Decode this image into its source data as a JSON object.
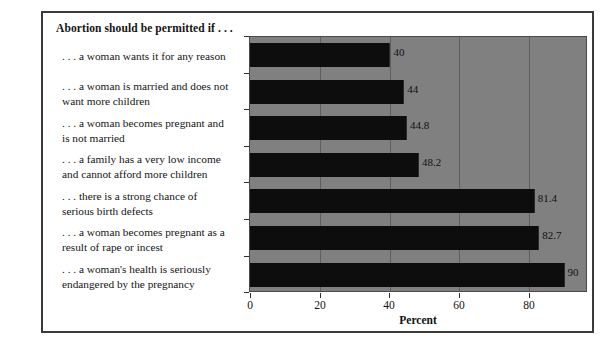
{
  "chart_data": {
    "type": "bar",
    "orientation": "horizontal",
    "title": "Abortion should be permitted if . . .",
    "xlabel": "Percent",
    "ylabel": "",
    "xlim": [
      0,
      97
    ],
    "xticks": [
      0,
      20,
      40,
      60,
      80
    ],
    "xticklabels": [
      "0",
      "20",
      "40",
      "60",
      "80"
    ],
    "grid": true,
    "grid_axis": "x",
    "legend": null,
    "bar_color": "#0d0d0d",
    "plot_background": "#808080",
    "categories": [
      ". . . a woman wants it for any reason",
      ". . . a woman is married and does not want more children",
      ". . . a woman becomes pregnant and is not married",
      ". . . a family has a very low income and cannot afford more children",
      ". . . there is a strong chance of serious birth defects",
      ". . . a woman becomes pregnant as a result of rape or incest",
      ". . . a woman's health is seriously endangered by the pregnancy"
    ],
    "category_lines": [
      [
        ". . . a woman wants it for any reason"
      ],
      [
        ". . . a woman is married and does not",
        "want more children"
      ],
      [
        ". . . a woman becomes pregnant and",
        "is not married"
      ],
      [
        ". . . a family has a very low income",
        "and cannot afford more children"
      ],
      [
        ". . . there is a strong chance of",
        "serious birth defects"
      ],
      [
        ". . . a woman becomes pregnant as a",
        "result of rape or incest"
      ],
      [
        ". . . a woman's health is seriously",
        "endangered by the pregnancy"
      ]
    ],
    "values": [
      40,
      44,
      44.8,
      48.2,
      81.4,
      82.7,
      90
    ],
    "value_labels": [
      "40",
      "44",
      "44.8",
      "48.2",
      "81.4",
      "82.7",
      "90"
    ]
  }
}
